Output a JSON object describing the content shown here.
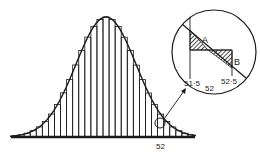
{
  "chart_data": {
    "type": "bar",
    "title": "",
    "bins": 30,
    "curve": "normal",
    "xlabel": "",
    "ylabel": "",
    "axis_labels": [
      "52"
    ],
    "inset": {
      "labels": {
        "left_edge": "51·5",
        "center": "52",
        "right_edge": "52·5",
        "area_a": "A",
        "area_b": "B"
      }
    }
  },
  "labels": {
    "axis_mark": "52",
    "inset_left": "51·5",
    "inset_center": "52",
    "inset_right": "52·5",
    "area_a": "A",
    "area_b": "B"
  },
  "colors": {
    "ink": "#1a1a1a",
    "background": "#ffffff"
  }
}
